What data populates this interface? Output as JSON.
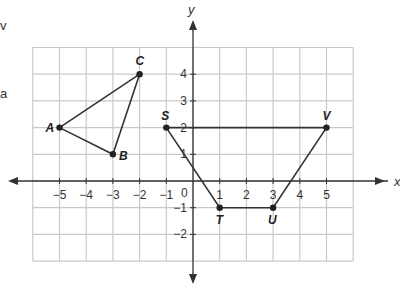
{
  "clipped_text": {
    "line1": "v",
    "line2": "a"
  },
  "axes": {
    "x_label": "x",
    "y_label": "y",
    "origin_label": "0",
    "x_ticks": [
      "-5",
      "-4",
      "-3",
      "-2",
      "-1",
      "1",
      "2",
      "3",
      "4",
      "5"
    ],
    "y_ticks": [
      "4",
      "3",
      "2",
      "1",
      "-1",
      "-2"
    ]
  },
  "grid": {
    "x_min": -6,
    "x_max": 6,
    "y_min": -3,
    "y_max": 5
  },
  "triangle": {
    "vertices": [
      {
        "label": "A",
        "x": -5,
        "y": 2
      },
      {
        "label": "B",
        "x": -3,
        "y": 1
      },
      {
        "label": "C",
        "x": -2,
        "y": 4
      }
    ]
  },
  "trapezoid": {
    "vertices": [
      {
        "label": "S",
        "x": -1,
        "y": 2
      },
      {
        "label": "T",
        "x": 1,
        "y": -1
      },
      {
        "label": "U",
        "x": 3,
        "y": -1
      },
      {
        "label": "V",
        "x": 5,
        "y": 2
      }
    ]
  }
}
